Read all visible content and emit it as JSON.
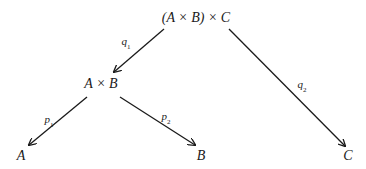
{
  "diagram": {
    "nodes": {
      "top": "(A × B) × C",
      "ab": "A × B",
      "a": "A",
      "b": "B",
      "c": "C"
    },
    "arrows": {
      "q1": {
        "name": "q",
        "sub": "1",
        "from": "(A × B) × C",
        "to": "A × B"
      },
      "q2": {
        "name": "q",
        "sub": "2",
        "from": "(A × B) × C",
        "to": "C"
      },
      "p1": {
        "name": "p",
        "sub": "1",
        "from": "A × B",
        "to": "A"
      },
      "p2": {
        "name": "p",
        "sub": "2",
        "from": "A × B",
        "to": "B"
      }
    }
  }
}
